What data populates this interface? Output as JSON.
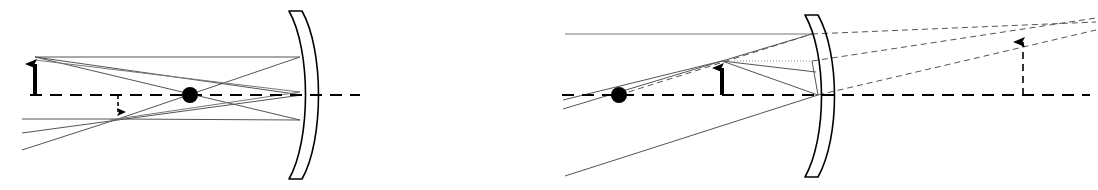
{
  "figure": {
    "width": 1098,
    "height": 190,
    "background_color": "#ffffff",
    "ink_color": "#000000",
    "ray_color": "#555555",
    "faint_ray_color": "#777777",
    "panels": [
      {
        "id": "left-panel",
        "name": "object-beyond-center-of-curvature",
        "caption": "",
        "axis": {
          "name": "principal-axis",
          "style": "dashed",
          "y": 95,
          "x_start": 30,
          "x_end": 360,
          "color": "#000000"
        },
        "mirror": {
          "name": "concave-mirror",
          "orientation": "concave-left",
          "vertex_x": 302,
          "vertex_y": 95,
          "top_y": 11,
          "bottom_y": 179,
          "thickness": 13,
          "bulge": 22,
          "color": "#000000"
        },
        "focal_point": {
          "name": "focal-point-dot",
          "x": 190,
          "y": 95,
          "radius": 8,
          "color": "#000000",
          "label": ""
        },
        "object_arrow": {
          "name": "object-arrow",
          "x": 35,
          "base_y": 95,
          "tip_y": 57,
          "direction": "up",
          "style": "solid",
          "color": "#000000"
        },
        "image_arrow": {
          "name": "image-arrow",
          "x": 118,
          "base_y": 95,
          "tip_y": 119,
          "direction": "down",
          "style": "dashed",
          "color": "#000000"
        },
        "rays": [
          {
            "name": "parallel-incident-ray-top",
            "points": "35,57 300,57",
            "style": "solid"
          },
          {
            "name": "reflected-ray-through-focus",
            "points": "300,57 118,119",
            "style": "solid"
          },
          {
            "name": "reflected-ray-extension-low",
            "points": "118,119 22,150",
            "style": "solid"
          },
          {
            "name": "ray-through-focus-incident",
            "points": "35,57 300,120",
            "style": "solid"
          },
          {
            "name": "reflected-parallel-ray-bottom",
            "points": "300,120 118,119",
            "style": "solid"
          },
          {
            "name": "parallel-return-ray-left",
            "points": "118,119 22,119",
            "style": "solid"
          },
          {
            "name": "chief-ray-to-vertex",
            "points": "35,57 302,95",
            "style": "solid"
          },
          {
            "name": "chief-ray-reflected",
            "points": "302,95 22,133",
            "style": "solid"
          },
          {
            "name": "secondary-ray-upper",
            "points": "35,60 300,92",
            "style": "solid"
          },
          {
            "name": "secondary-ray-lower-return",
            "points": "300,92 110,120",
            "style": "solid"
          }
        ]
      },
      {
        "id": "right-panel",
        "name": "object-between-focus-and-mirror",
        "caption": "",
        "axis": {
          "name": "principal-axis",
          "style": "dashed",
          "y": 95,
          "x_start": 562,
          "x_end": 1090,
          "color": "#000000"
        },
        "mirror": {
          "name": "concave-mirror",
          "orientation": "concave-left",
          "vertex_x": 818,
          "vertex_y": 95,
          "top_y": 15,
          "bottom_y": 177,
          "thickness": 13,
          "bulge": 22,
          "color": "#000000"
        },
        "focal_point": {
          "name": "focal-point-dot",
          "x": 619,
          "y": 95,
          "radius": 8,
          "color": "#000000",
          "label": ""
        },
        "object_arrow": {
          "name": "object-arrow",
          "x": 722,
          "base_y": 95,
          "tip_y": 61,
          "direction": "up",
          "style": "solid",
          "color": "#000000"
        },
        "image_arrow": {
          "name": "virtual-image-arrow",
          "x": 1023,
          "base_y": 95,
          "tip_y": 34,
          "direction": "up",
          "style": "dashed",
          "color": "#000000"
        },
        "rays": [
          {
            "name": "parallel-incident-ray-top",
            "points": "565,34 812,34",
            "style": "solid"
          },
          {
            "name": "reflected-ray-through-focus",
            "points": "812,34 722,61",
            "style": "solid"
          },
          {
            "name": "reflected-ray-continues",
            "points": "722,61 563,109",
            "style": "solid"
          },
          {
            "name": "virtual-ray-extension-top",
            "points": "812,34 1096,22",
            "style": "dashed"
          },
          {
            "name": "focal-ray-incident",
            "points": "619,95 812,34",
            "style": "dashed"
          },
          {
            "name": "focal-ray-incident-extend",
            "points": "619,95 563,113",
            "style": "dashed"
          },
          {
            "name": "ray-to-vertex-from-tip",
            "points": "722,61 818,95",
            "style": "solid"
          },
          {
            "name": "ray-from-vertex-down-left",
            "points": "818,95 565,176",
            "style": "solid"
          },
          {
            "name": "ray-from-vertex-up-right",
            "points": "818,95 1096,30",
            "style": "dashed"
          },
          {
            "name": "horizontal-ray-from-tip",
            "points": "722,61 812,61",
            "style": "dotted"
          },
          {
            "name": "reflected-from-61-downward",
            "points": "812,61 818,95",
            "style": "solid"
          },
          {
            "name": "virtual-ray-upper-right",
            "points": "812,61 1096,18",
            "style": "dashed"
          },
          {
            "name": "incident-through-dot-to-tip",
            "points": "563,100 722,61",
            "style": "solid"
          },
          {
            "name": "ray-tip-to-mirror-mid",
            "points": "722,61 816,72",
            "style": "solid"
          }
        ]
      }
    ]
  }
}
